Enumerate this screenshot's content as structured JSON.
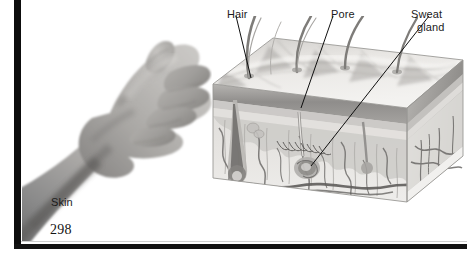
{
  "page": {
    "number": "298",
    "background_color": "#ffffff",
    "frame_color": "#0d0d0d",
    "text_color": "#1b1b1b"
  },
  "figure": {
    "photo": {
      "caption": "Skin",
      "subject": "hand-and-forearm-photograph",
      "style": "grayscale"
    },
    "diagram": {
      "subject": "skin-cross-section-block",
      "style": "grayscale-illustration",
      "labels": [
        {
          "id": "hair",
          "text": "Hair"
        },
        {
          "id": "pore",
          "text": "Pore"
        },
        {
          "id": "sweat",
          "text": "Sweat"
        },
        {
          "id": "gland",
          "text": "gland"
        }
      ]
    }
  },
  "colors": {
    "ink": "#1b1b1b",
    "leader_line": "#0f0f0f",
    "epidermis_top": "#e8e6e4",
    "epidermis_band": "#8d8d8f",
    "dermis": "#d8d6d3",
    "hypodermis": "#efeeec",
    "vessel": "#6a6a6c"
  }
}
